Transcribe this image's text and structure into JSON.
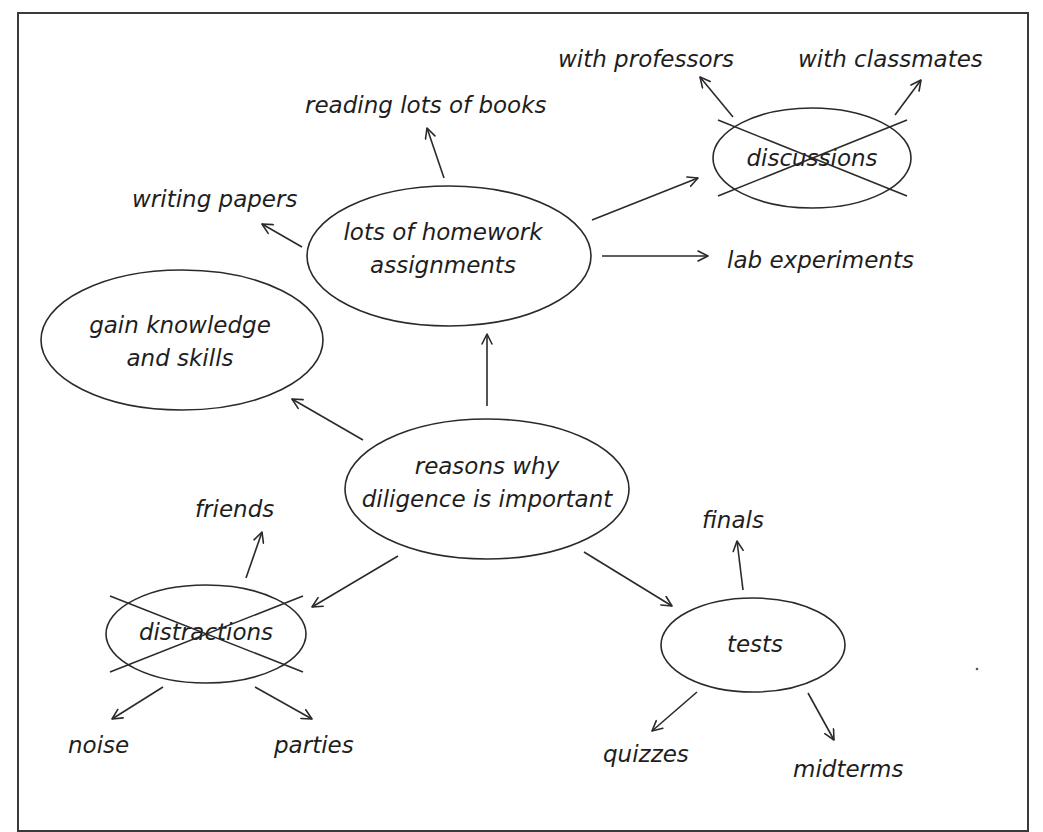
{
  "diagram": {
    "type": "mind-map",
    "title": "reasons why diligence is important",
    "colors": {
      "line": "#2a2a2a",
      "text": "#1e1e1e",
      "frame": "#3a3a3a",
      "background": "#ffffff"
    },
    "nodes": {
      "center": {
        "lines": [
          "reasons why",
          "diligence is important"
        ],
        "crossed_out": false,
        "cx": 487,
        "cy": 489,
        "rx": 142,
        "ry": 70
      },
      "homework": {
        "lines": [
          "lots of homework",
          "assignments"
        ],
        "crossed_out": false,
        "cx": 449,
        "cy": 256,
        "rx": 142,
        "ry": 70
      },
      "gain": {
        "lines": [
          "gain knowledge",
          "and skills"
        ],
        "crossed_out": false,
        "cx": 182,
        "cy": 340,
        "rx": 141,
        "ry": 70
      },
      "discussions": {
        "lines": [
          "discussions"
        ],
        "crossed_out": true,
        "cx": 812,
        "cy": 158,
        "rx": 99,
        "ry": 50
      },
      "distractions": {
        "lines": [
          "distractions"
        ],
        "crossed_out": true,
        "cx": 206,
        "cy": 634,
        "rx": 100,
        "ry": 49
      },
      "tests": {
        "lines": [
          "tests"
        ],
        "crossed_out": false,
        "cx": 753,
        "cy": 645,
        "rx": 92,
        "ry": 47
      }
    },
    "leaves": {
      "reading": {
        "text": "reading lots of books",
        "parent": "homework",
        "x": 305,
        "y": 113
      },
      "writing": {
        "text": "writing papers",
        "parent": "homework",
        "x": 132,
        "y": 207
      },
      "lab": {
        "text": "lab experiments",
        "parent": "homework",
        "x": 727,
        "y": 268
      },
      "professors": {
        "text": "with professors",
        "parent": "discussions",
        "x": 558,
        "y": 67
      },
      "classmates": {
        "text": "with classmates",
        "parent": "discussions",
        "x": 798,
        "y": 67
      },
      "friends": {
        "text": "friends",
        "parent": "distractions",
        "x": 195,
        "y": 517
      },
      "noise": {
        "text": "noise",
        "parent": "distractions",
        "x": 68,
        "y": 753
      },
      "parties": {
        "text": "parties",
        "parent": "distractions",
        "x": 274,
        "y": 753
      },
      "finals": {
        "text": "finals",
        "parent": "tests",
        "x": 702,
        "y": 528
      },
      "quizzes": {
        "text": "quizzes",
        "parent": "tests",
        "x": 603,
        "y": 762
      },
      "midterms": {
        "text": "midterms",
        "parent": "tests",
        "x": 793,
        "y": 777
      }
    },
    "edges": [
      {
        "from": "center",
        "to": "homework"
      },
      {
        "from": "center",
        "to": "gain"
      },
      {
        "from": "center",
        "to": "distractions"
      },
      {
        "from": "center",
        "to": "tests"
      },
      {
        "from": "homework",
        "to": "reading"
      },
      {
        "from": "homework",
        "to": "writing"
      },
      {
        "from": "homework",
        "to": "discussions"
      },
      {
        "from": "homework",
        "to": "lab"
      },
      {
        "from": "discussions",
        "to": "professors"
      },
      {
        "from": "discussions",
        "to": "classmates"
      },
      {
        "from": "distractions",
        "to": "friends"
      },
      {
        "from": "distractions",
        "to": "noise"
      },
      {
        "from": "distractions",
        "to": "parties"
      },
      {
        "from": "tests",
        "to": "finals"
      },
      {
        "from": "tests",
        "to": "quizzes"
      },
      {
        "from": "tests",
        "to": "midterms"
      }
    ]
  }
}
